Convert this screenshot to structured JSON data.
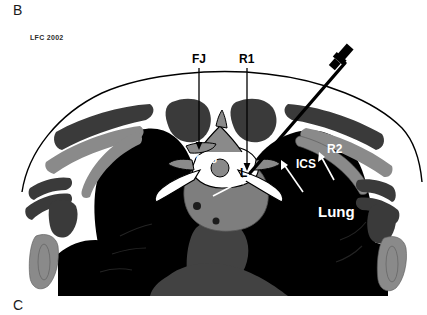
{
  "figure": {
    "panel_label_top": "B",
    "panel_label_bottom": "C",
    "credit": "LFC 2002",
    "modality": "axial chest cross-section illustration"
  },
  "annotations": {
    "fj": "FJ",
    "r1": "R1",
    "cvj": "CVJ",
    "l": "L",
    "ics": "ICS",
    "r2": "R2",
    "lung": "Lung"
  },
  "colors": {
    "background": "#ffffff",
    "lung_black": "#000000",
    "muscle_dark_gray": "#3a3a3a",
    "bone_mid_gray": "#8a8a8a",
    "lesion_gray": "#7e7e7e",
    "mediastinum_gray": "#424242",
    "skin_outline": "#000000",
    "label_dark": "#000000",
    "label_light": "#ffffff"
  }
}
